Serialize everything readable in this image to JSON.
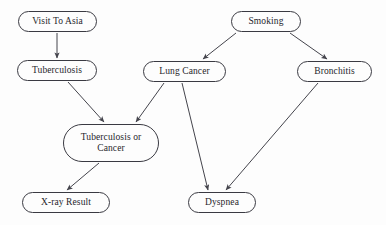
{
  "diagram": {
    "type": "directed-acyclic-graph",
    "background_color": "#fdfdfd",
    "node_stroke_color": "#3a3a42",
    "edge_color": "#44444c",
    "text_color": "#26262c",
    "width": 386,
    "height": 225,
    "nodes": [
      {
        "id": "visit_to_asia",
        "label": "Visit To Asia",
        "x": 18,
        "y": 11,
        "w": 79,
        "h": 21,
        "font_size": 9.5
      },
      {
        "id": "smoking",
        "label": "Smoking",
        "x": 231,
        "y": 11,
        "w": 70,
        "h": 21,
        "font_size": 9.5
      },
      {
        "id": "tuberculosis",
        "label": "Tuberculosis",
        "x": 17,
        "y": 60,
        "w": 80,
        "h": 21,
        "font_size": 9.5
      },
      {
        "id": "lung_cancer",
        "label": "Lung Cancer",
        "x": 143,
        "y": 61,
        "w": 83,
        "h": 21,
        "font_size": 9.5
      },
      {
        "id": "bronchitis",
        "label": "Bronchitis",
        "x": 297,
        "y": 61,
        "w": 75,
        "h": 21,
        "font_size": 9.5
      },
      {
        "id": "tuberculosis_or_cancer",
        "label": "Tuberculosis or\nCancer",
        "x": 63,
        "y": 124,
        "w": 96,
        "h": 38,
        "font_size": 9.5
      },
      {
        "id": "xray_result",
        "label": "X-ray Result",
        "x": 22,
        "y": 192,
        "w": 88,
        "h": 21,
        "font_size": 9.5
      },
      {
        "id": "dyspnea",
        "label": "Dyspnea",
        "x": 188,
        "y": 192,
        "w": 68,
        "h": 21,
        "font_size": 9.5
      }
    ],
    "edges": [
      {
        "id": "visit_to_asia-to-tuberculosis",
        "from": "visit_to_asia",
        "to": "tuberculosis",
        "x1": 57,
        "y1": 33,
        "x2": 57,
        "y2": 58
      },
      {
        "id": "tuberculosis-to-tuberculosis_or_cancer",
        "from": "tuberculosis",
        "to": "tuberculosis_or_cancer",
        "x1": 68,
        "y1": 82,
        "x2": 104,
        "y2": 122
      },
      {
        "id": "smoking-to-lung_cancer",
        "from": "smoking",
        "to": "lung_cancer",
        "x1": 236,
        "y1": 33,
        "x2": 203,
        "y2": 59
      },
      {
        "id": "smoking-to-bronchitis",
        "from": "smoking",
        "to": "bronchitis",
        "x1": 290,
        "y1": 33,
        "x2": 327,
        "y2": 59
      },
      {
        "id": "lung_cancer-to-tuberculosis_or_cancer",
        "from": "lung_cancer",
        "to": "tuberculosis_or_cancer",
        "x1": 164,
        "y1": 83,
        "x2": 136,
        "y2": 122
      },
      {
        "id": "lung_cancer-to-dyspnea",
        "from": "lung_cancer",
        "to": "dyspnea",
        "x1": 182,
        "y1": 83,
        "x2": 208,
        "y2": 190
      },
      {
        "id": "bronchitis-to-dyspnea",
        "from": "bronchitis",
        "to": "dyspnea",
        "x1": 318,
        "y1": 83,
        "x2": 226,
        "y2": 190
      },
      {
        "id": "tuberculosis_or_cancer-to-xray_result",
        "from": "tuberculosis_or_cancer",
        "to": "xray_result",
        "x1": 99,
        "y1": 163,
        "x2": 67,
        "y2": 190
      }
    ]
  }
}
